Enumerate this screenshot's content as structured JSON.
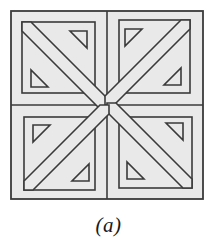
{
  "figure": {
    "caption": "(a)",
    "colors": {
      "background": "#ffffff",
      "fill": "#e9e9e9",
      "stroke": "#3a3a3a",
      "caption_text": "#1a1a1a"
    },
    "geometry": {
      "outer_square": {
        "x": 11,
        "y": 11,
        "width": 192,
        "height": 188
      },
      "center": {
        "x": 107,
        "y": 105
      },
      "quadrant_count": 4,
      "symmetry": "4-fold rotational",
      "stroke_width": 1.6,
      "band_width": 13,
      "inner_frame_inset": 11,
      "notch_triangle_size": 17,
      "notches_per_quadrant": 2
    },
    "elements": [
      {
        "name": "outer-border",
        "count": 1
      },
      {
        "name": "center-vertical-divider",
        "count": 1
      },
      {
        "name": "center-horizontal-divider",
        "count": 1
      },
      {
        "name": "quadrant-inner-frame",
        "count": 4
      },
      {
        "name": "diagonal-band",
        "count": 4
      },
      {
        "name": "corner-notch-triangle",
        "count": 8
      }
    ]
  }
}
